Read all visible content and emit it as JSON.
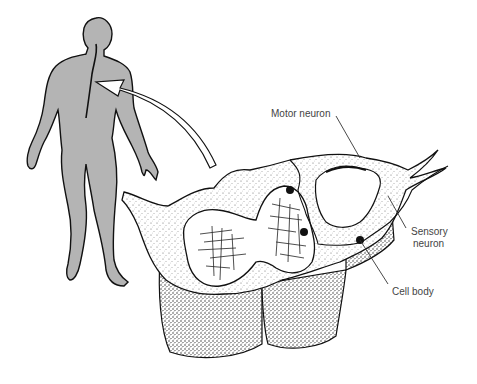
{
  "diagram": {
    "labels": {
      "motor_neuron": "Motor neuron",
      "sensory_neuron_line1": "Sensory",
      "sensory_neuron_line2": "neuron",
      "cell_body": "Cell body"
    },
    "colors": {
      "body_fill": "#b4b4b4",
      "outline": "#111111",
      "label_text": "#444444",
      "background": "#ffffff"
    }
  }
}
